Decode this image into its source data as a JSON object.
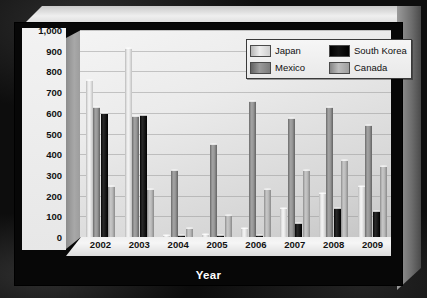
{
  "chart_data": {
    "type": "bar",
    "title": "",
    "xlabel": "Year",
    "ylabel": "Volume (million lbs. carcass weight)",
    "ylabel_line1": "Volume",
    "ylabel_line2": "(million lbs. carcass weight)",
    "categories": [
      "2002",
      "2003",
      "2004",
      "2005",
      "2006",
      "2007",
      "2008",
      "2009"
    ],
    "ylim": [
      0,
      1000
    ],
    "yticks": [
      0,
      100,
      200,
      300,
      400,
      500,
      600,
      700,
      800,
      900,
      1000
    ],
    "ytick_labels": [
      "0",
      "100",
      "200",
      "300",
      "400",
      "500",
      "600",
      "700",
      "800",
      "900",
      "1,000"
    ],
    "grid": true,
    "legend_position": "top-right",
    "series": [
      {
        "name": "Japan",
        "color": "#ededed",
        "values": [
          755,
          910,
          5,
          10,
          40,
          135,
          210,
          240
        ]
      },
      {
        "name": "Mexico",
        "color": "#9a9a9a",
        "values": [
          625,
          580,
          320,
          445,
          650,
          570,
          625,
          535
        ]
      },
      {
        "name": "South Korea",
        "color": "#121212",
        "values": [
          595,
          585,
          2,
          3,
          2,
          65,
          135,
          120
        ]
      },
      {
        "name": "Canada",
        "color": "#bdbdbd",
        "values": [
          240,
          225,
          40,
          100,
          225,
          320,
          365,
          340
        ]
      }
    ]
  },
  "legend": {
    "items": [
      {
        "label": "Japan",
        "series": "Japan"
      },
      {
        "label": "South Korea",
        "series": "South Korea"
      },
      {
        "label": "Mexico",
        "series": "Mexico"
      },
      {
        "label": "Canada",
        "series": "Canada"
      }
    ]
  },
  "colors": {
    "background": "#0d0d0d",
    "chart_face": "#070707",
    "plot_background": "#ebebeb",
    "axis_text": "#121212",
    "title_text": "#ffffff"
  }
}
